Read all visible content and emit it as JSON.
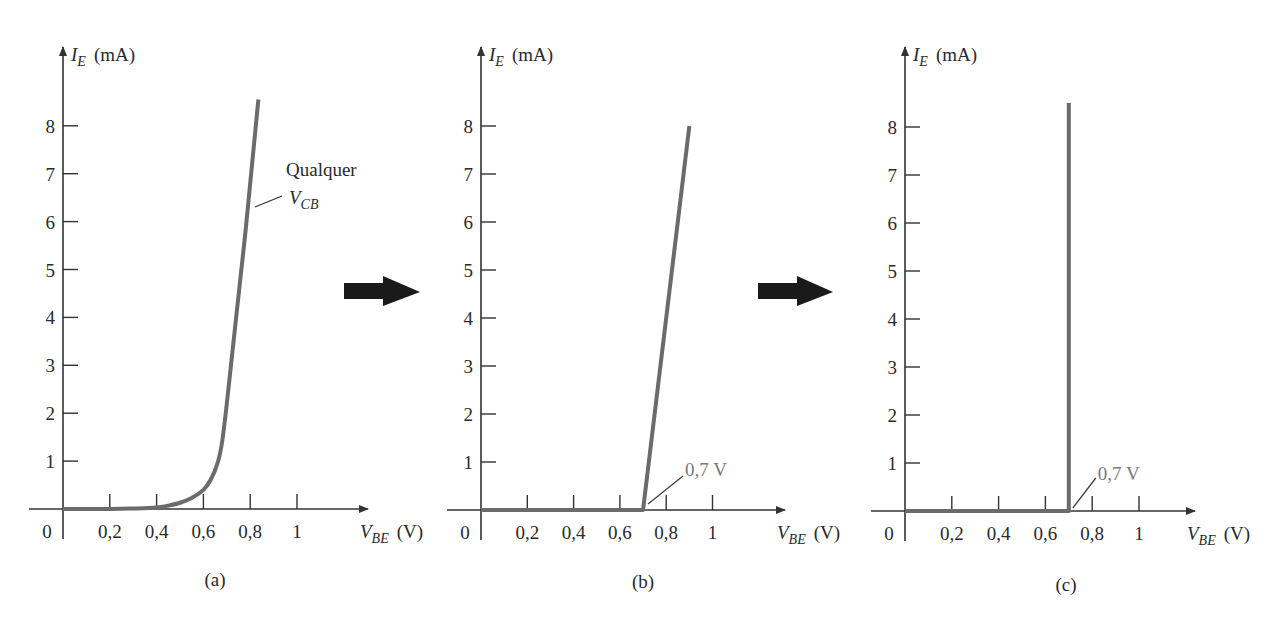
{
  "chart_data": [
    {
      "id": "a",
      "type": "line",
      "caption": "(a)",
      "title": "",
      "ylabel": {
        "symbol": "I",
        "sub": "E",
        "unit": "(mA)"
      },
      "xlabel": {
        "symbol": "V",
        "sub": "BE",
        "unit": "(V)"
      },
      "x_ticks": [
        "0",
        "0,2",
        "0,4",
        "0,6",
        "0,8",
        "1"
      ],
      "x_tick_values": [
        0,
        0.2,
        0.4,
        0.6,
        0.8,
        1.0
      ],
      "y_ticks": [
        "1",
        "2",
        "3",
        "4",
        "5",
        "6",
        "7",
        "8"
      ],
      "y_tick_values": [
        1,
        2,
        3,
        4,
        5,
        6,
        7,
        8
      ],
      "xlim": [
        0,
        1.3
      ],
      "ylim": [
        0,
        9.5
      ],
      "grid": false,
      "series": [
        {
          "name": "Qualquer V_CB",
          "x": [
            0,
            0.2,
            0.3,
            0.4,
            0.45,
            0.5,
            0.55,
            0.6,
            0.63,
            0.66,
            0.68,
            0.7,
            0.72,
            0.74,
            0.76,
            0.78,
            0.8,
            0.82,
            0.835
          ],
          "y": [
            0,
            0,
            0.01,
            0.03,
            0.07,
            0.13,
            0.23,
            0.4,
            0.6,
            0.95,
            1.4,
            2.2,
            3.1,
            4.0,
            4.9,
            5.8,
            6.8,
            7.8,
            8.55
          ]
        }
      ],
      "annotations": [
        {
          "text_line1": "Qualquer",
          "text_line2_symbol": "V",
          "text_line2_sub": "CB"
        }
      ]
    },
    {
      "id": "b",
      "type": "line",
      "caption": "(b)",
      "title": "",
      "ylabel": {
        "symbol": "I",
        "sub": "E",
        "unit": "(mA)"
      },
      "xlabel": {
        "symbol": "V",
        "sub": "BE",
        "unit": "(V)"
      },
      "x_ticks": [
        "0",
        "0,2",
        "0,4",
        "0,6",
        "0,8",
        "1"
      ],
      "x_tick_values": [
        0,
        0.2,
        0.4,
        0.6,
        0.8,
        1.0
      ],
      "y_ticks": [
        "1",
        "2",
        "3",
        "4",
        "5",
        "6",
        "7",
        "8"
      ],
      "y_tick_values": [
        1,
        2,
        3,
        4,
        5,
        6,
        7,
        8
      ],
      "xlim": [
        0,
        1.3
      ],
      "ylim": [
        0,
        9.5
      ],
      "grid": false,
      "series": [
        {
          "name": "piecewise-linear",
          "x": [
            0,
            0.7,
            0.9
          ],
          "y": [
            0,
            0,
            8
          ]
        }
      ],
      "annotations": [
        {
          "text": "0,7 V",
          "points_to": [
            0.7,
            0
          ]
        }
      ]
    },
    {
      "id": "c",
      "type": "line",
      "caption": "(c)",
      "title": "",
      "ylabel": {
        "symbol": "I",
        "sub": "E",
        "unit": "(mA)"
      },
      "xlabel": {
        "symbol": "V",
        "sub": "BE",
        "unit": "(V)"
      },
      "x_ticks": [
        "0",
        "0,2",
        "0,4",
        "0,6",
        "0,8",
        "1"
      ],
      "x_tick_values": [
        0,
        0.2,
        0.4,
        0.6,
        0.8,
        1.0
      ],
      "y_ticks": [
        "1",
        "2",
        "3",
        "4",
        "5",
        "6",
        "7",
        "8"
      ],
      "y_tick_values": [
        1,
        2,
        3,
        4,
        5,
        6,
        7,
        8
      ],
      "xlim": [
        0,
        1.3
      ],
      "ylim": [
        0,
        9.5
      ],
      "grid": false,
      "series": [
        {
          "name": "ideal",
          "x": [
            0,
            0.7,
            0.7
          ],
          "y": [
            0,
            0,
            8.5
          ]
        }
      ],
      "annotations": [
        {
          "text": "0,7 V",
          "points_to": [
            0.7,
            0
          ]
        }
      ]
    }
  ],
  "arrows": [
    {
      "from": "a",
      "to": "b",
      "icon": "right-arrow-icon"
    },
    {
      "from": "b",
      "to": "c",
      "icon": "right-arrow-icon"
    }
  ],
  "colors": {
    "curve": "#6b6b6b",
    "axis": "#333333",
    "arrow": "#1a1a1a",
    "annotation_gray": "#7a7a7a"
  }
}
